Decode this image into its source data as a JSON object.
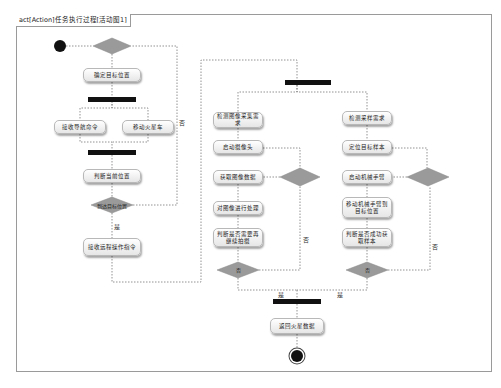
{
  "diagram": {
    "title": "act[Action]任务执行过程[活动图1]",
    "colors": {
      "decision_fill": "#9a9a9a",
      "bar": "#111111",
      "edge": "#777777",
      "node_border": "#b8b8b8"
    },
    "nodes": {
      "n1": "确定目标位置",
      "n2": "接收导航命令",
      "n3": "移动火星车",
      "n4": "判断当前位置",
      "n5": "接收远程操作指令",
      "n6": "检测图像采集需求",
      "n7": "启动摄像头",
      "n8": "获取图像数据",
      "n9": "对图像进行处理",
      "n10": "判断是否需要再继续拍摄",
      "n11": "检测采样需求",
      "n12": "定位目标样本",
      "n13": "启动机械手臂",
      "n14": "移动机械手臂到目标位置",
      "n15": "判断是否成功获取样本",
      "n16": "返回火星数据"
    },
    "decisions": {
      "d2": "到达目标位置",
      "d4": "否",
      "d6": "否"
    },
    "guards": {
      "left_yes": "是",
      "left_no": "否",
      "img_no": "否",
      "sample_no": "否",
      "join_left": "是",
      "join_right": "是"
    }
  }
}
